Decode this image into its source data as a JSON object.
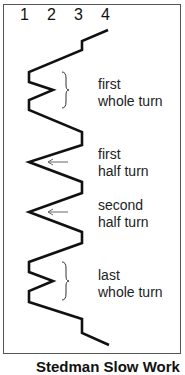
{
  "diagram": {
    "bell_columns": [
      "1",
      "2",
      "3",
      "4"
    ],
    "labels": [
      {
        "line1": "first",
        "line2": "whole turn"
      },
      {
        "line1": "first",
        "line2": "half turn"
      },
      {
        "line1": "second",
        "line2": "half turn"
      },
      {
        "line1": "last",
        "line2": "whole turn"
      }
    ],
    "caption": "Stedman Slow Work",
    "colors": {
      "line": "#111111",
      "arrow": "#666666",
      "frame": "#555555"
    }
  }
}
